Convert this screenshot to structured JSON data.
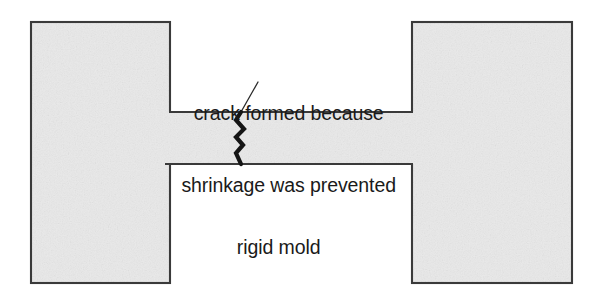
{
  "figure": {
    "kind": "engineering-cross-section-diagram",
    "width": 604,
    "height": 298,
    "background_color": "#ffffff"
  },
  "annotations": {
    "crack_callout": {
      "line1": "crack formed because",
      "line2": "shrinkage was prevented",
      "text_color": "#1a1a1a",
      "leader_line": {
        "from_x": 258,
        "from_y": 82,
        "to_x": 241,
        "to_y": 112,
        "color": "#2b2b2b",
        "width": 1.3
      }
    },
    "mold_label": {
      "text": "rigid mold",
      "text_color": "#1a1a1a"
    }
  },
  "geometry": {
    "fill_color": "#e9e9e9",
    "stroke_color": "#3a3a3a",
    "stroke_width": 2.1,
    "left_block": {
      "x": 31,
      "y": 22,
      "width": 139,
      "height": 261
    },
    "right_block": {
      "x": 412,
      "y": 22,
      "width": 160,
      "height": 261
    },
    "neck": {
      "x": 170,
      "y": 112,
      "width": 242,
      "height": 52
    },
    "top_notch": {
      "x": 170,
      "y": 22,
      "width": 234,
      "height": 90
    },
    "bottom_notch": {
      "x": 166,
      "y": 164,
      "width": 246,
      "height": 119
    }
  },
  "crack": {
    "color": "#151515",
    "width": 4.2,
    "description": "jagged vertical crack through the narrow neck",
    "points": [
      [
        241,
        112
      ],
      [
        236,
        120
      ],
      [
        244,
        129
      ],
      [
        236,
        137
      ],
      [
        243,
        145
      ],
      [
        236,
        153
      ],
      [
        241,
        164
      ]
    ]
  }
}
